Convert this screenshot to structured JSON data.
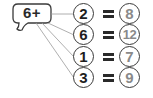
{
  "bubble": {
    "label": "6+"
  },
  "equations": [
    {
      "operand": "2",
      "equals": "=",
      "result": "8"
    },
    {
      "operand": "6",
      "equals": "=",
      "result": "12"
    },
    {
      "operand": "1",
      "equals": "=",
      "result": "7"
    },
    {
      "operand": "3",
      "equals": "=",
      "result": "9"
    }
  ],
  "colors": {
    "operand_text": "#1e1e1e",
    "result_text": "#8a8a8a",
    "stroke": "#3a3a3a",
    "connector": "#9a9a9a"
  }
}
